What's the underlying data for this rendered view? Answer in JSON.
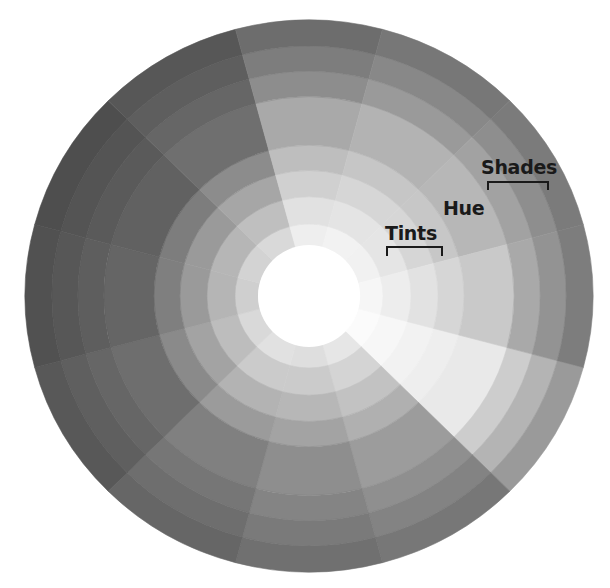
{
  "diagram": {
    "type": "grayscale color wheel",
    "center": {
      "x": 309,
      "y": 296
    },
    "scale_y": 0.972,
    "hole_radius": 51,
    "wedge_count": 12,
    "wedge_start_angle_deg": 15,
    "ring_radii": [
      51,
      74,
      102,
      129,
      155,
      205,
      231,
      257,
      284
    ],
    "rings": [
      "tint-4",
      "tint-3",
      "tint-2",
      "tint-1",
      "hue",
      "shade-1",
      "shade-2",
      "shade-3"
    ],
    "wedges": [
      {
        "center_angle_deg": 30,
        "hue_gray": "#e9e9e9",
        "tones": [
          "#fbfbfb",
          "#f7f7f7",
          "#f2f2f2",
          "#eeeeee",
          "#e9e9e9",
          "#cdcdcd",
          "#b4b4b4",
          "#9a9a9a"
        ]
      },
      {
        "center_angle_deg": 60,
        "hue_gray": "#9c9c9c",
        "tones": [
          "#e6e6e6",
          "#d4d4d4",
          "#c2c2c2",
          "#b0b0b0",
          "#9c9c9c",
          "#8f8f8f",
          "#838383",
          "#777777"
        ]
      },
      {
        "center_angle_deg": 90,
        "hue_gray": "#8e8e8e",
        "tones": [
          "#dedede",
          "#cbcbcb",
          "#b7b7b7",
          "#a3a3a3",
          "#8e8e8e",
          "#848484",
          "#7a7a7a",
          "#707070"
        ]
      },
      {
        "center_angle_deg": 120,
        "hue_gray": "#808080",
        "tones": [
          "#e1e1e1",
          "#cbcbcb",
          "#b3b3b3",
          "#9b9b9b",
          "#808080",
          "#767676",
          "#6e6e6e",
          "#666666"
        ]
      },
      {
        "center_angle_deg": 150,
        "hue_gray": "#6e6e6e",
        "tones": [
          "#d9d9d9",
          "#bdbdbd",
          "#a3a3a3",
          "#8a8a8a",
          "#6e6e6e",
          "#666666",
          "#5f5f5f",
          "#585858"
        ]
      },
      {
        "center_angle_deg": 180,
        "hue_gray": "#656565",
        "tones": [
          "#cfcfcf",
          "#b5b5b5",
          "#9a9a9a",
          "#7f7f7f",
          "#656565",
          "#5e5e5e",
          "#575757",
          "#515151"
        ]
      },
      {
        "center_angle_deg": 210,
        "hue_gray": "#616161",
        "tones": [
          "#d3d3d3",
          "#b6b6b6",
          "#9a9a9a",
          "#7d7d7d",
          "#616161",
          "#5a5a5a",
          "#545454",
          "#4e4e4e"
        ]
      },
      {
        "center_angle_deg": 240,
        "hue_gray": "#6f6f6f",
        "tones": [
          "#d9d9d9",
          "#bfbfbf",
          "#a6a6a6",
          "#8c8c8c",
          "#6f6f6f",
          "#666666",
          "#5e5e5e",
          "#575757"
        ]
      },
      {
        "center_angle_deg": 270,
        "hue_gray": "#a9a9a9",
        "tones": [
          "#eeeeee",
          "#e1e1e1",
          "#d0d0d0",
          "#bebebe",
          "#a9a9a9",
          "#8d8d8d",
          "#7d7d7d",
          "#6d6d6d"
        ]
      },
      {
        "center_angle_deg": 300,
        "hue_gray": "#b3b3b3",
        "tones": [
          "#f2f2f2",
          "#e4e4e4",
          "#d6d6d6",
          "#c6c6c6",
          "#b3b3b3",
          "#9a9a9a",
          "#888888",
          "#777777"
        ]
      },
      {
        "center_angle_deg": 330,
        "hue_gray": "#b7b7b7",
        "tones": [
          "#f1f1f1",
          "#e5e5e5",
          "#d6d6d6",
          "#c7c7c7",
          "#b7b7b7",
          "#a2a2a2",
          "#8e8e8e",
          "#7b7b7b"
        ]
      },
      {
        "center_angle_deg": 0,
        "hue_gray": "#c9c9c9",
        "tones": [
          "#f6f6f6",
          "#ededed",
          "#e2e2e2",
          "#d6d6d6",
          "#c9c9c9",
          "#a9a9a9",
          "#939393",
          "#7d7d7d"
        ]
      }
    ]
  },
  "labels": {
    "hue": "Hue",
    "tints": "Tints",
    "shades": "Shades"
  },
  "colors": {
    "background": "#ffffff",
    "center_hole": "#ffffff",
    "text": "#1a1a1a"
  }
}
